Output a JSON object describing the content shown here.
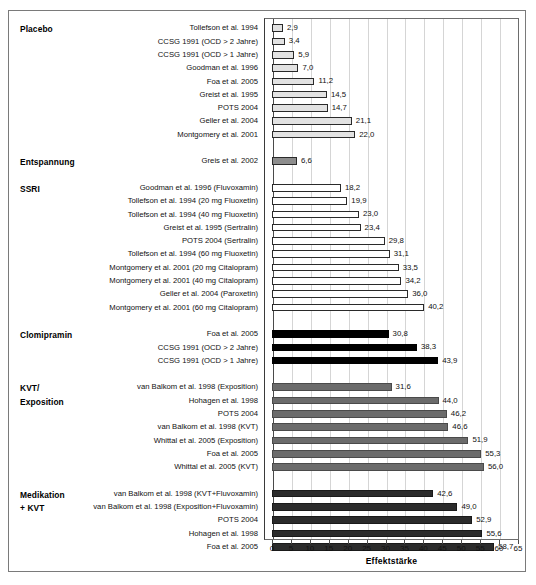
{
  "chart_data": {
    "type": "bar",
    "orientation": "horizontal",
    "title": "",
    "xlabel": "Effektstärke",
    "ylabel": "",
    "xlim": [
      0,
      65
    ],
    "xticks": [
      0,
      5,
      10,
      15,
      20,
      25,
      30,
      35,
      40,
      45,
      50,
      55,
      60,
      65
    ],
    "grid": "vertical",
    "legend": "none",
    "decimal_separator": ",",
    "groups": [
      {
        "name": "Placebo",
        "style": "placebo",
        "color": "#e2e2e2",
        "items": [
          {
            "label": "Tollefson et al. 1994",
            "value": 2.9,
            "display": "2,9"
          },
          {
            "label": "CCSG 1991 (OCD > 2 Jahre)",
            "value": 3.4,
            "display": "3,4"
          },
          {
            "label": "CCSG 1991 (OCD > 1 Jahre)",
            "value": 5.9,
            "display": "5,9"
          },
          {
            "label": "Goodman et al. 1996",
            "value": 7.0,
            "display": "7,0"
          },
          {
            "label": "Foa et al. 2005",
            "value": 11.2,
            "display": "11,2"
          },
          {
            "label": "Greist et al. 1995",
            "value": 14.5,
            "display": "14,5"
          },
          {
            "label": "POTS 2004",
            "value": 14.7,
            "display": "14,7"
          },
          {
            "label": "Geller et al. 2004",
            "value": 21.1,
            "display": "21,1"
          },
          {
            "label": "Montgomery et al. 2001",
            "value": 22.0,
            "display": "22,0"
          }
        ]
      },
      {
        "name": "Entspannung",
        "style": "entsp",
        "color": "#8d8d8d",
        "items": [
          {
            "label": "Greis et al. 2002",
            "value": 6.6,
            "display": "6,6"
          }
        ]
      },
      {
        "name": "SSRI",
        "style": "ssri",
        "color": "#ffffff",
        "items": [
          {
            "label": "Goodman et al. 1996 (Fluvoxamin)",
            "value": 18.2,
            "display": "18,2"
          },
          {
            "label": "Tollefson et al. 1994 (20 mg Fluoxetin)",
            "value": 19.9,
            "display": "19,9"
          },
          {
            "label": "Tollefson et al. 1994 (40 mg Fluoxetin)",
            "value": 23.0,
            "display": "23,0"
          },
          {
            "label": "Greist et al. 1995 (Sertralin)",
            "value": 23.4,
            "display": "23,4"
          },
          {
            "label": "POTS 2004 (Sertralin)",
            "value": 29.8,
            "display": "29,8"
          },
          {
            "label": "Tollefson et al. 1994 (60 mg Fluoxetin)",
            "value": 31.1,
            "display": "31,1"
          },
          {
            "label": "Montgomery et al. 2001 (20 mg Citalopram)",
            "value": 33.5,
            "display": "33,5"
          },
          {
            "label": "Montgomery et al. 2001 (40 mg Citalopram)",
            "value": 34.2,
            "display": "34,2"
          },
          {
            "label": "Geller et al. 2004 (Paroxetin)",
            "value": 36.0,
            "display": "36,0"
          },
          {
            "label": "Montgomery et al. 2001 (60 mg Citalopram)",
            "value": 40.2,
            "display": "40,2"
          }
        ]
      },
      {
        "name": "Clomipramin",
        "style": "clomi",
        "color": "#000000",
        "items": [
          {
            "label": "Foa et al. 2005",
            "value": 30.8,
            "display": "30,8"
          },
          {
            "label": "CCSG 1991 (OCD > 2 Jahre)",
            "value": 38.3,
            "display": "38,3"
          },
          {
            "label": "CCSG 1991 (OCD > 1 Jahre)",
            "value": 43.9,
            "display": "43,9"
          }
        ]
      },
      {
        "name": "KVT/\nExposition",
        "style": "kvt",
        "color": "#6b6b6b",
        "items": [
          {
            "label": "van Balkom et al. 1998 (Exposition)",
            "value": 31.6,
            "display": "31,6"
          },
          {
            "label": "Hohagen et al. 1998",
            "value": 44.0,
            "display": "44,0"
          },
          {
            "label": "POTS 2004",
            "value": 46.2,
            "display": "46,2"
          },
          {
            "label": "van Balkom et al. 1998 (KVT)",
            "value": 46.6,
            "display": "46,6"
          },
          {
            "label": "Whittal et al. 2005 (Exposition)",
            "value": 51.9,
            "display": "51,9"
          },
          {
            "label": "Foa et al. 2005",
            "value": 55.3,
            "display": "55,3"
          },
          {
            "label": "Whittal et al. 2005 (KVT)",
            "value": 56.0,
            "display": "56,0"
          }
        ]
      },
      {
        "name": "Medikation\n+ KVT",
        "style": "medkvt",
        "color": "#2b2b2b",
        "items": [
          {
            "label": "van Balkom et al. 1998 (KVT+Fluvoxamin)",
            "value": 42.6,
            "display": "42,6"
          },
          {
            "label": "van Balkom et al. 1998 (Exposition+Fluvoxamin)",
            "value": 49.0,
            "display": "49,0"
          },
          {
            "label": "POTS 2004",
            "value": 52.9,
            "display": "52,9"
          },
          {
            "label": "Hohagen et al. 1998",
            "value": 55.6,
            "display": "55,6"
          },
          {
            "label": "Foa et al. 2005",
            "value": 58.7,
            "display": "58,7"
          }
        ]
      }
    ]
  }
}
